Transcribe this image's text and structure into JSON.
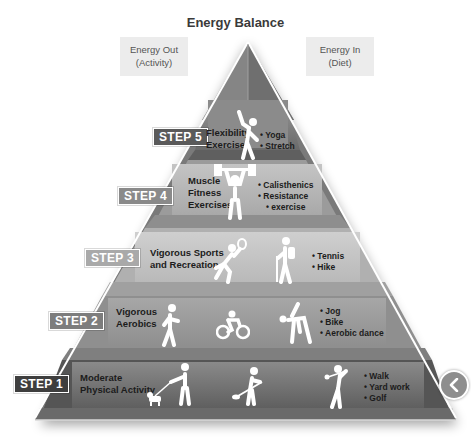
{
  "diagram": {
    "title": "Energy Balance",
    "energy_out": {
      "line1": "Energy Out",
      "line2": "(Activity)"
    },
    "energy_in": {
      "line1": "Energy In",
      "line2": "(Diet)"
    },
    "steps": [
      {
        "label": "STEP 5",
        "label_color": "#5a5a5a",
        "title_lines": [
          "Flexibility",
          "Exercises"
        ],
        "bullets": [
          "Yoga",
          "Stretch"
        ],
        "icons": [
          "stretching-person-icon"
        ]
      },
      {
        "label": "STEP 4",
        "label_color": "#8a8a8a",
        "title_lines": [
          "Muscle",
          "Fitness",
          "Exercises"
        ],
        "bullets": [
          "Calisthenics",
          "Resistance",
          "exercise"
        ],
        "icons": [
          "weightlifter-icon"
        ]
      },
      {
        "label": "STEP 3",
        "label_color": "#a9a9a9",
        "title_lines": [
          "Vigorous Sports",
          "and Recreation"
        ],
        "bullets": [
          "Tennis",
          "Hike"
        ],
        "icons": [
          "tennis-player-icon",
          "hiker-icon"
        ]
      },
      {
        "label": "STEP 2",
        "label_color": "#7d7d7d",
        "title_lines": [
          "Vigorous",
          "Aerobics"
        ],
        "bullets": [
          "Jog",
          "Bike",
          "Aerobic dance"
        ],
        "icons": [
          "jogger-icon",
          "cyclist-icon",
          "aerobic-dancer-icon"
        ]
      },
      {
        "label": "STEP 1",
        "label_color": "#3e3e3e",
        "title_lines": [
          "Moderate",
          "Physical Activity"
        ],
        "bullets": [
          "Walk",
          "Yard work",
          "Golf"
        ],
        "icons": [
          "dog-walker-icon",
          "yard-worker-icon",
          "golfer-icon"
        ]
      }
    ]
  },
  "nav": {
    "previous_icon": "chevron-left-icon"
  }
}
